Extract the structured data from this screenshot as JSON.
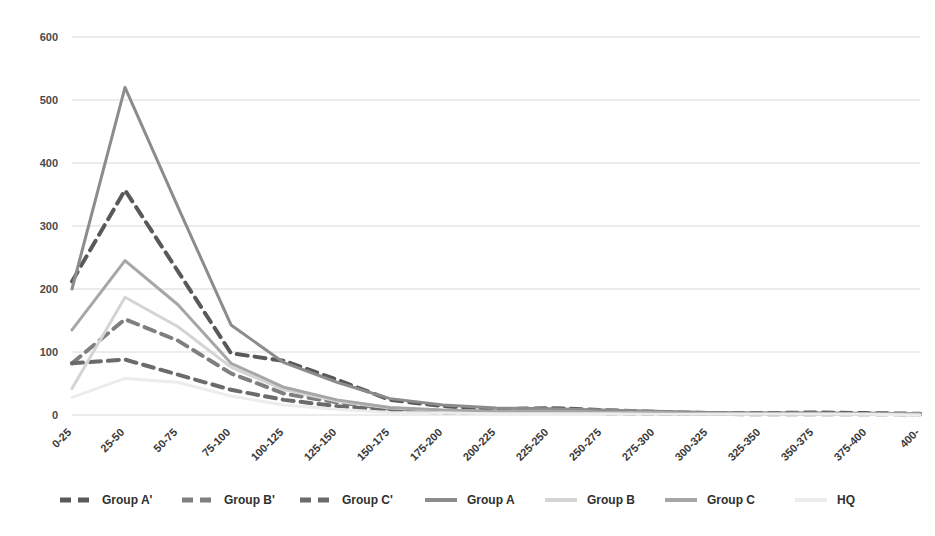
{
  "chart_data": {
    "type": "line",
    "title": "",
    "subtitle": "",
    "xlabel": "",
    "ylabel": "",
    "ylim": [
      0,
      600
    ],
    "yticks": [
      0,
      100,
      200,
      300,
      400,
      500,
      600
    ],
    "ytick_labels": [
      "0",
      "100",
      "200",
      "300",
      "400",
      "500",
      "600"
    ],
    "grid": true,
    "grid_axis": "y",
    "legend_position": "bottom",
    "categories": [
      "0-25",
      "25-50",
      "50-75",
      "75-100",
      "100-125",
      "125-150",
      "150-175",
      "175-200",
      "200-225",
      "225-250",
      "250-275",
      "275-300",
      "300-325",
      "325-350",
      "350-375",
      "375-400",
      "400-"
    ],
    "series": [
      {
        "name": "Group A'",
        "style": "dashed",
        "color": "#595959",
        "width": 4,
        "values": [
          212,
          357,
          228,
          98,
          86,
          56,
          24,
          14,
          9,
          11,
          8,
          5,
          3,
          3,
          4,
          3,
          2
        ]
      },
      {
        "name": "Group B'",
        "style": "dashed",
        "color": "#7f7f7f",
        "width": 4,
        "values": [
          82,
          152,
          118,
          66,
          34,
          20,
          10,
          6,
          5,
          6,
          4,
          3,
          2,
          2,
          2,
          2,
          1
        ]
      },
      {
        "name": "Group C'",
        "style": "dashed",
        "color": "#6b6b6b",
        "width": 4,
        "values": [
          82,
          88,
          64,
          40,
          24,
          14,
          7,
          4,
          3,
          4,
          3,
          2,
          2,
          1,
          1,
          1,
          1
        ]
      },
      {
        "name": "Group A",
        "style": "solid",
        "color": "#8c8c8c",
        "width": 3,
        "values": [
          200,
          520,
          330,
          143,
          83,
          52,
          26,
          16,
          11,
          10,
          8,
          6,
          4,
          3,
          3,
          2,
          2
        ]
      },
      {
        "name": "Group B",
        "style": "solid",
        "color": "#d4d4d4",
        "width": 3,
        "values": [
          42,
          187,
          140,
          76,
          40,
          22,
          11,
          7,
          5,
          5,
          4,
          3,
          2,
          2,
          2,
          1,
          1
        ]
      },
      {
        "name": "Group C",
        "style": "solid",
        "color": "#a6a6a6",
        "width": 3,
        "values": [
          135,
          245,
          175,
          82,
          44,
          24,
          12,
          8,
          6,
          6,
          4,
          3,
          2,
          2,
          2,
          1,
          1
        ]
      },
      {
        "name": "HQ",
        "style": "solid",
        "color": "#ececec",
        "width": 3,
        "values": [
          28,
          58,
          52,
          30,
          16,
          9,
          4,
          3,
          2,
          2,
          2,
          1,
          1,
          1,
          1,
          1,
          0
        ]
      }
    ]
  },
  "legend": {
    "items": [
      {
        "label": "Group A'"
      },
      {
        "label": "Group B'"
      },
      {
        "label": "Group C'"
      },
      {
        "label": "Group A"
      },
      {
        "label": "Group B"
      },
      {
        "label": "Group C"
      },
      {
        "label": "HQ"
      }
    ]
  },
  "colors": {
    "background": "#ffffff",
    "gridline": "#d9d9d9",
    "axis_text": "#4a4a4a"
  }
}
